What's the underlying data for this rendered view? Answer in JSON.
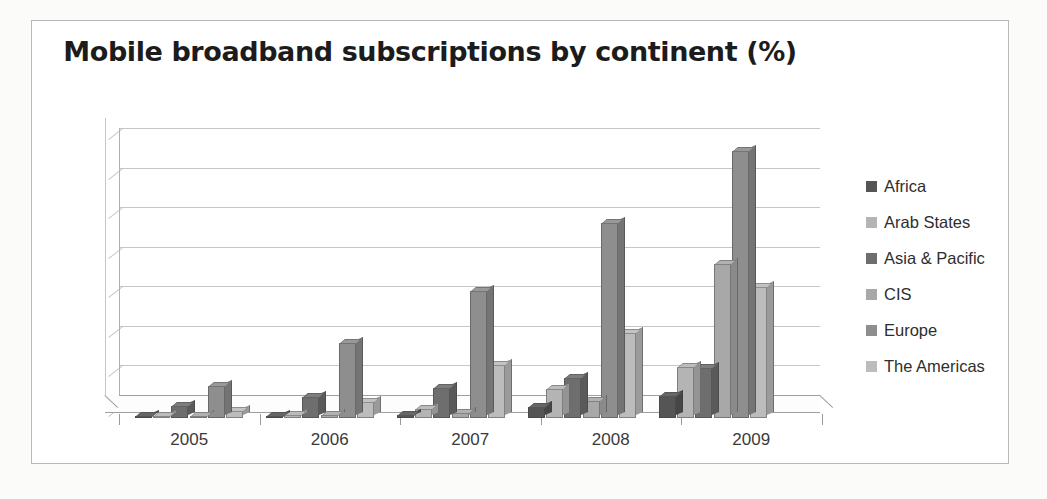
{
  "frame": {
    "visible": true
  },
  "chart_data": {
    "type": "bar",
    "title": "Mobile broadband subscriptions by continent (%)",
    "xlabel": "",
    "ylabel": "",
    "categories": [
      "2005",
      "2006",
      "2007",
      "2008",
      "2009"
    ],
    "ylim": [
      0,
      35
    ],
    "yticks": [
      0,
      5,
      10,
      15,
      20,
      25,
      30,
      35
    ],
    "ytick_labels": [
      "0",
      "5",
      "10",
      "15",
      "20",
      "25",
      "30",
      "35"
    ],
    "grid": true,
    "legend_position": "right",
    "style": "3d-clustered-column",
    "series": [
      {
        "name": "Africa",
        "color": "#555555",
        "values": [
          0.2,
          0.3,
          0.4,
          1.4,
          2.8
        ]
      },
      {
        "name": "Arab States",
        "color": "#b4b4b4",
        "values": [
          0.2,
          0.4,
          1.2,
          3.7,
          6.5
        ]
      },
      {
        "name": "Asia & Pacific",
        "color": "#6e6e6e",
        "values": [
          1.5,
          2.7,
          3.8,
          5.0,
          6.3
        ]
      },
      {
        "name": "CIS",
        "color": "#a8a8a8",
        "values": [
          0.2,
          0.4,
          0.6,
          2.2,
          19.5
        ]
      },
      {
        "name": "Europe",
        "color": "#8e8e8e",
        "values": [
          4.1,
          9.5,
          16.0,
          24.7,
          33.7
        ]
      },
      {
        "name": "The Americas",
        "color": "#bcbcbc",
        "values": [
          0.9,
          2.0,
          6.7,
          10.8,
          16.5
        ]
      }
    ]
  },
  "legend": {
    "items": [
      {
        "label": "Africa"
      },
      {
        "label": "Arab States"
      },
      {
        "label": "Asia & Pacific"
      },
      {
        "label": "CIS"
      },
      {
        "label": "Europe"
      },
      {
        "label": "The Americas"
      }
    ]
  }
}
